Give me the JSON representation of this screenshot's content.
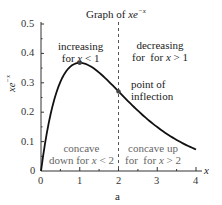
{
  "chart_data": {
    "type": "line",
    "title_prefix": "Graph of ",
    "title_fn": "xe",
    "title_exp": "−x",
    "xlabel": "x",
    "ylabel": "xe^{-x}",
    "ylabel_base": "xe",
    "ylabel_exp": "−x",
    "caption": "a",
    "xlim": [
      0,
      4
    ],
    "ylim": [
      0,
      0.5
    ],
    "x_ticks": [
      "0",
      "1",
      "2",
      "3",
      "4"
    ],
    "y_ticks": [
      "0",
      "0.1",
      "0.2",
      "0.3",
      "0.4",
      "0.5"
    ],
    "grid": false,
    "series": [
      {
        "name": "xe^{-x}",
        "x": [
          0,
          0.25,
          0.5,
          0.75,
          1.0,
          1.25,
          1.5,
          1.75,
          2.0,
          2.25,
          2.5,
          2.75,
          3.0,
          3.25,
          3.5,
          3.75,
          4.0
        ],
        "values": [
          0,
          0.195,
          0.303,
          0.354,
          0.368,
          0.358,
          0.335,
          0.304,
          0.271,
          0.237,
          0.205,
          0.175,
          0.149,
          0.126,
          0.106,
          0.088,
          0.073
        ]
      }
    ],
    "points": [
      {
        "name": "maximum",
        "x": 1,
        "y": 0.368
      },
      {
        "name": "point of inflection",
        "x": 2,
        "y": 0.271
      }
    ],
    "vertical_line": {
      "x": 2,
      "style": "dashed"
    },
    "annotations": {
      "increasing": {
        "line1": "increasing",
        "line2_prefix": "for ",
        "line2_var": "x",
        "line2_rel": " < 1"
      },
      "decreasing": {
        "line1": "decreasing",
        "line2_prefix": "for  for ",
        "line2_var": "x",
        "line2_rel": " > 1"
      },
      "inflection": {
        "line1": "point of",
        "line2": "inflection"
      },
      "concave_down": {
        "line1": "concave",
        "line2_prefix": "down for ",
        "line2_var": "x",
        "line2_rel": " < 2"
      },
      "concave_up": {
        "line1": "concave up",
        "line2_prefix": "for  for ",
        "line2_var": "x",
        "line2_rel": " > 2"
      }
    }
  }
}
